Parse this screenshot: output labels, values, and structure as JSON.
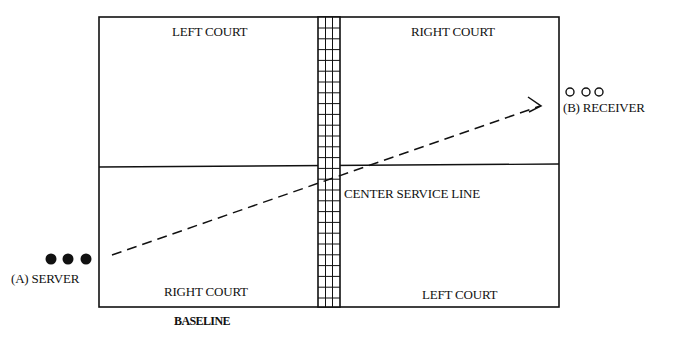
{
  "diagram": {
    "court_labels": {
      "top_left": "LEFT COURT",
      "top_right": "RIGHT COURT",
      "bottom_left": "RIGHT COURT",
      "bottom_right": "LEFT COURT"
    },
    "center_line_label": "CENTER SERVICE LINE",
    "baseline_label": "BASELINE",
    "server": {
      "label": "(A) SERVER",
      "markers": "filled-dots",
      "count": 3
    },
    "receiver": {
      "label": "(B) RECEIVER",
      "markers": "open-circles",
      "count": 3
    },
    "serve_path": {
      "style": "dashed-arrow",
      "from": "server",
      "to": "receiver"
    },
    "colors": {
      "line": "#111111",
      "background": "#ffffff"
    }
  }
}
